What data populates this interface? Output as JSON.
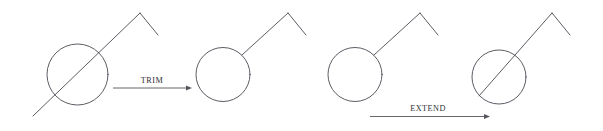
{
  "canvas": {
    "width": 603,
    "height": 131,
    "background": "#ffffff",
    "stroke_color": "#4a4a52",
    "arrow_color": "#55555c",
    "text_color": "#2e2e33"
  },
  "figures": [
    {
      "id": "before-trim",
      "name": "circle-with-crossing-line",
      "description": "Circle crossed by a diagonal line that extends past the circle on the lower left and continues up-right to a chevron peak",
      "circle": {
        "cx": 77.5,
        "cy": 74.5,
        "r": 30.5
      },
      "diagonal": {
        "x1": 33,
        "y1": 116,
        "x2": 140,
        "y2": 13
      },
      "chevron": {
        "peak_x": 140,
        "peak_y": 13,
        "end_x": 158,
        "end_y": 35
      }
    },
    {
      "id": "after-trim",
      "name": "circle-with-trimmed-line",
      "description": "Circle with the line trimmed at the circle boundary; line runs from circle edge up-right to a chevron peak",
      "circle": {
        "cx": 223,
        "cy": 74.5,
        "r": 27
      },
      "diagonal": {
        "x1": 242,
        "y1": 55,
        "x2": 288,
        "y2": 13
      },
      "chevron": {
        "peak_x": 288,
        "peak_y": 13,
        "end_x": 306,
        "end_y": 35
      }
    },
    {
      "id": "before-extend",
      "name": "circle-with-short-line",
      "description": "Circle with a line starting at the circle boundary running up-right to a chevron peak",
      "circle": {
        "cx": 355,
        "cy": 74.5,
        "r": 27
      },
      "diagonal": {
        "x1": 374,
        "y1": 55,
        "x2": 420,
        "y2": 13
      },
      "chevron": {
        "peak_x": 420,
        "peak_y": 13,
        "end_x": 438,
        "end_y": 35
      }
    },
    {
      "id": "after-extend",
      "name": "circle-with-extended-line",
      "description": "Circle with the line extended through it, terminating at the lower-left circle boundary",
      "circle": {
        "cx": 499,
        "cy": 77,
        "r": 27
      },
      "diagonal": {
        "x1": 479,
        "y1": 96,
        "x2": 552,
        "y2": 13
      },
      "chevron": {
        "peak_x": 552,
        "peak_y": 13,
        "end_x": 570,
        "end_y": 35
      }
    }
  ],
  "operations": [
    {
      "id": "trim",
      "label": "TRIM",
      "label_x": 152,
      "label_y": 83,
      "arrow": {
        "x1": 113,
        "y1": 88,
        "x2": 192,
        "y2": 88
      }
    },
    {
      "id": "extend",
      "label": "EXTEND",
      "label_x": 428,
      "label_y": 111,
      "arrow": {
        "x1": 370,
        "y1": 116.5,
        "x2": 490,
        "y2": 116.5
      }
    }
  ]
}
